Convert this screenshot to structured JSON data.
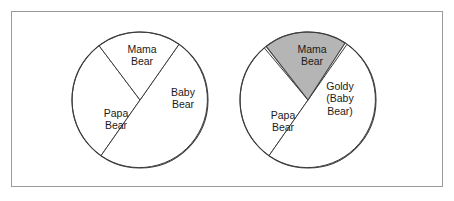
{
  "figure": {
    "title": "",
    "background_color": "#ffffff",
    "frame_color": "#9a9a9a"
  },
  "chart_data": [
    {
      "type": "pie",
      "name": "left-pie",
      "title": "",
      "xlabel": "",
      "ylabel": "",
      "center": [
        140,
        100
      ],
      "radius": 68,
      "legend": "none",
      "grid": false,
      "categories": [
        "Mama Bear",
        "Papa Bear",
        "Baby Bear"
      ],
      "values": [
        30,
        50,
        20
      ],
      "slices": [
        {
          "label_line1": "Mama",
          "label_line2": "Bear",
          "label_line3": "",
          "value": 30,
          "start_angle_deg": 215,
          "end_angle_deg": 323,
          "fill": "#ffffff",
          "stroke": "#3c3c3c",
          "label_x": 142,
          "label_y": 56
        },
        {
          "label_line1": "Papa",
          "label_line2": "Bear",
          "label_line3": "",
          "value": 50,
          "start_angle_deg": 35,
          "end_angle_deg": 215,
          "fill": "#ffffff",
          "stroke": "#3c3c3c",
          "label_x": 116,
          "label_y": 120
        },
        {
          "label_line1": "Baby",
          "label_line2": "Bear",
          "label_line3": "",
          "value": 20,
          "start_angle_deg": 323,
          "end_angle_deg": 395,
          "fill": "#ffffff",
          "stroke": "#3c3c3c",
          "label_x": 183,
          "label_y": 99
        }
      ]
    },
    {
      "type": "pie",
      "name": "right-pie",
      "title": "",
      "xlabel": "",
      "ylabel": "",
      "center": [
        308,
        100
      ],
      "radius": 68,
      "legend": "none",
      "grid": false,
      "categories": [
        "Mama Bear",
        "Papa Bear",
        "Goldy (Baby Bear)"
      ],
      "values": [
        30,
        50,
        20
      ],
      "slices": [
        {
          "label_line1": "Mama",
          "label_line2": "Bear",
          "label_line3": "",
          "value": 30,
          "start_angle_deg": 215,
          "end_angle_deg": 320,
          "fill": "#ffffff",
          "stroke": "#3c3c3c",
          "label_x": 312,
          "label_y": 56
        },
        {
          "label_line1": "Papa",
          "label_line2": "Bear",
          "label_line3": "",
          "value": 50,
          "start_angle_deg": 35,
          "end_angle_deg": 215,
          "fill": "#ffffff",
          "stroke": "#3c3c3c",
          "label_x": 283,
          "label_y": 122
        },
        {
          "label_line1": "Goldy",
          "label_line2": "(Baby",
          "label_line3": "Bear)",
          "value": 20,
          "start_angle_deg": 322,
          "end_angle_deg": 393,
          "fill": "#b5b5b5",
          "stroke": "#3c3c3c",
          "label_x": 340,
          "label_y": 99,
          "highlighted": true
        }
      ]
    }
  ]
}
